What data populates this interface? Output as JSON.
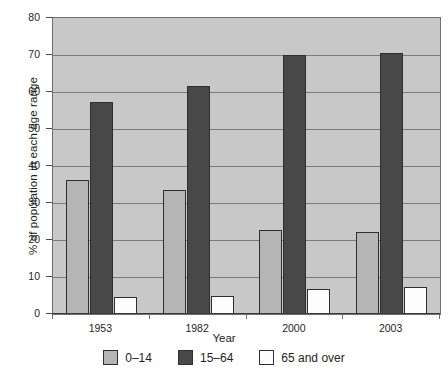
{
  "chart_data": {
    "type": "bar",
    "title": "",
    "xlabel": "Year",
    "ylabel": "% of population in each age range",
    "categories": [
      "1953",
      "1982",
      "2000",
      "2003"
    ],
    "series": [
      {
        "name": "0–14",
        "color": "#b5b5b5",
        "values": [
          36.2,
          33.6,
          22.8,
          22.1
        ]
      },
      {
        "name": "15–64",
        "color": "#484848",
        "values": [
          57.3,
          61.7,
          70.0,
          70.5
        ]
      },
      {
        "name": "65 and over",
        "color": "#fdfdfd",
        "values": [
          4.6,
          4.8,
          6.8,
          7.3
        ]
      }
    ],
    "ylim": [
      0,
      80
    ],
    "yticks": [
      0,
      10,
      20,
      30,
      40,
      50,
      60,
      70,
      80
    ],
    "ytick_labels": [
      "0",
      "10",
      "20",
      "30",
      "40",
      "50",
      "60",
      "70",
      "80"
    ],
    "grid": true,
    "legend_position": "bottom",
    "plot_background": "#c8c8c8",
    "grid_color": "#7a7a7a",
    "axis_color": "#3a3a3a"
  }
}
